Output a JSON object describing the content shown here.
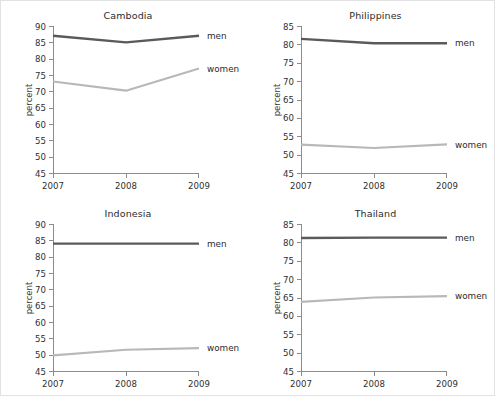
{
  "figure": {
    "background_color": "#ffffff",
    "border_color": "#e2e2e2",
    "men_color": "#5a5a5a",
    "women_color": "#b8b8b8"
  },
  "chart_data": [
    {
      "type": "line",
      "title": "Cambodia",
      "xlabel": "",
      "ylabel": "percent",
      "x": [
        "2007",
        "2008",
        "2009"
      ],
      "xtick_labels": [
        "2007",
        "2008",
        "2009"
      ],
      "ytick_labels": [
        "45",
        "50",
        "55",
        "60",
        "65",
        "70",
        "75",
        "80",
        "85",
        "90"
      ],
      "ylim": [
        45,
        90
      ],
      "ytick_step": 5,
      "grid": false,
      "legend_position": "right-inline",
      "series": [
        {
          "name": "men",
          "values": [
            87.0,
            85.0,
            87.0
          ],
          "color": "#5a5a5a"
        },
        {
          "name": "women",
          "values": [
            73.0,
            70.2,
            77.0
          ],
          "color": "#b8b8b8"
        }
      ]
    },
    {
      "type": "line",
      "title": "Philippines",
      "xlabel": "",
      "ylabel": "percent",
      "x": [
        "2007",
        "2008",
        "2009"
      ],
      "xtick_labels": [
        "2007",
        "2008",
        "2009"
      ],
      "ytick_labels": [
        "45",
        "50",
        "55",
        "60",
        "65",
        "70",
        "75",
        "80",
        "85"
      ],
      "ylim": [
        45,
        85
      ],
      "ytick_step": 5,
      "grid": false,
      "legend_position": "right-inline",
      "series": [
        {
          "name": "men",
          "values": [
            81.5,
            80.3,
            80.3
          ],
          "color": "#5a5a5a"
        },
        {
          "name": "women",
          "values": [
            52.7,
            51.8,
            52.8
          ],
          "color": "#b8b8b8"
        }
      ]
    },
    {
      "type": "line",
      "title": "Indonesia",
      "xlabel": "",
      "ylabel": "percent",
      "x": [
        "2007",
        "2008",
        "2009"
      ],
      "xtick_labels": [
        "2007",
        "2008",
        "2009"
      ],
      "ytick_labels": [
        "45",
        "50",
        "55",
        "60",
        "65",
        "70",
        "75",
        "80",
        "85",
        "90"
      ],
      "ylim": [
        45,
        90
      ],
      "ytick_step": 5,
      "grid": false,
      "legend_position": "right-inline",
      "series": [
        {
          "name": "men",
          "values": [
            84.0,
            84.0,
            84.0
          ],
          "color": "#5a5a5a"
        },
        {
          "name": "women",
          "values": [
            49.8,
            51.5,
            52.0
          ],
          "color": "#b8b8b8"
        }
      ]
    },
    {
      "type": "line",
      "title": "Thailand",
      "xlabel": "",
      "ylabel": "percent",
      "x": [
        "2007",
        "2008",
        "2009"
      ],
      "xtick_labels": [
        "2007",
        "2008",
        "2009"
      ],
      "ytick_labels": [
        "45",
        "50",
        "55",
        "60",
        "65",
        "70",
        "75",
        "80",
        "85"
      ],
      "ylim": [
        45,
        85
      ],
      "ytick_step": 5,
      "grid": false,
      "legend_position": "right-inline",
      "series": [
        {
          "name": "men",
          "values": [
            81.2,
            81.3,
            81.3
          ],
          "color": "#5a5a5a"
        },
        {
          "name": "women",
          "values": [
            63.8,
            65.0,
            65.4
          ],
          "color": "#b8b8b8"
        }
      ]
    }
  ]
}
